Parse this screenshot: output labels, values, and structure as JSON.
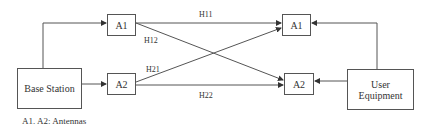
{
  "diagram": {
    "nodes": {
      "base_station": "Base Station",
      "bs_a1": "A1",
      "bs_a2": "A2",
      "ue_a1": "A1",
      "ue_a2": "A2",
      "user_equipment_line1": "User",
      "user_equipment_line2": "Equipment"
    },
    "channels": {
      "h11": "H11",
      "h12": "H12",
      "h21": "H21",
      "h22": "H22"
    },
    "caption": "A1. A2: Antennas",
    "edges": [
      {
        "from": "Base Station",
        "to": "A1 (BS)"
      },
      {
        "from": "Base Station",
        "to": "A2 (BS)"
      },
      {
        "from": "A1 (BS)",
        "to": "A1 (UE)",
        "label": "H11"
      },
      {
        "from": "A1 (BS)",
        "to": "A2 (UE)",
        "label": "H12"
      },
      {
        "from": "A2 (BS)",
        "to": "A1 (UE)",
        "label": "H21"
      },
      {
        "from": "A2 (BS)",
        "to": "A2 (UE)",
        "label": "H22"
      },
      {
        "from": "User Equipment",
        "to": "A1 (UE)"
      },
      {
        "from": "User Equipment",
        "to": "A2 (UE)"
      }
    ]
  }
}
